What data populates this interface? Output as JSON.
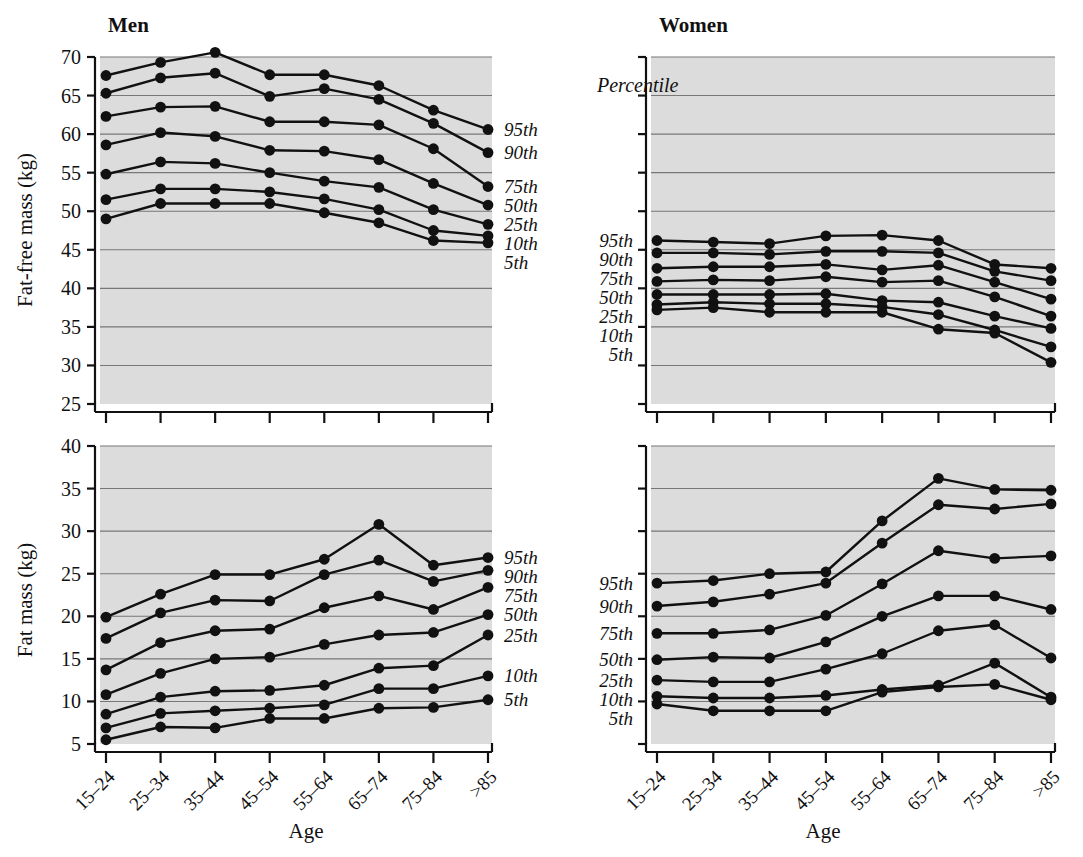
{
  "figure": {
    "panel_titles": {
      "men": "Men",
      "women": "Women"
    },
    "percentile_header": "Percentile",
    "x_axis_title": "Age",
    "y_axis_title_top": "Fat-free mass (kg)",
    "y_axis_title_bottom": "Fat mass (kg)",
    "age_groups": [
      "15–24",
      "25–34",
      "35–44",
      "45–54",
      "55–64",
      "65–74",
      "75–84",
      ">85"
    ],
    "percentile_labels": [
      "95th",
      "90th",
      "75th",
      "50th",
      "25th",
      "10th",
      "5th"
    ],
    "colors": {
      "plot_background": "#dcdcdc",
      "gridline": "#777777",
      "axis": "#111111",
      "marker": "#111111",
      "page_background": "#ffffff"
    }
  },
  "chart_data": [
    {
      "id": "men-fat-free-mass",
      "type": "line",
      "title": "Men",
      "xlabel": "Age",
      "ylabel": "Fat-free mass (kg)",
      "categories": [
        "15–24",
        "25–34",
        "35–44",
        "45–54",
        "55–64",
        "65–74",
        "75–84",
        ">85"
      ],
      "ylim": [
        25,
        70
      ],
      "yticks": [
        25,
        30,
        35,
        40,
        45,
        50,
        55,
        60,
        65,
        70
      ],
      "ytick_labels": [
        "25",
        "30",
        "35",
        "40",
        "45",
        "50",
        "55",
        "60",
        "65",
        "70"
      ],
      "grid": true,
      "legend": "right-edge-inline",
      "series": [
        {
          "name": "95th",
          "values": [
            67.6,
            69.3,
            70.6,
            67.7,
            67.7,
            66.3,
            63.1,
            60.6
          ]
        },
        {
          "name": "90th",
          "values": [
            65.3,
            67.3,
            67.9,
            64.9,
            65.9,
            64.5,
            61.4,
            57.6
          ]
        },
        {
          "name": "75th",
          "values": [
            62.3,
            63.5,
            63.6,
            61.6,
            61.6,
            61.2,
            58.1,
            53.2
          ]
        },
        {
          "name": "50th",
          "values": [
            58.6,
            60.2,
            59.7,
            57.9,
            57.8,
            56.7,
            53.6,
            50.8
          ]
        },
        {
          "name": "25th",
          "values": [
            54.8,
            56.4,
            56.2,
            55.0,
            53.9,
            53.1,
            50.2,
            48.3
          ]
        },
        {
          "name": "10th",
          "values": [
            51.5,
            52.9,
            52.9,
            52.5,
            51.6,
            50.2,
            47.5,
            46.8
          ]
        },
        {
          "name": "5th",
          "values": [
            49.0,
            51.0,
            51.0,
            51.0,
            49.8,
            48.5,
            46.2,
            45.9
          ]
        }
      ]
    },
    {
      "id": "women-fat-free-mass",
      "type": "line",
      "title": "Women",
      "xlabel": "Age",
      "ylabel": "Fat-free mass (kg)",
      "categories": [
        "15–24",
        "25–34",
        "35–44",
        "45–54",
        "55–64",
        "65–74",
        "75–84",
        ">85"
      ],
      "ylim": [
        25,
        70
      ],
      "yticks": [
        25,
        30,
        35,
        40,
        45,
        50,
        55,
        60,
        65,
        70
      ],
      "ytick_labels": [
        "",
        "",
        "",
        "",
        "",
        "",
        "",
        "",
        "",
        ""
      ],
      "grid": true,
      "legend": "left-edge-inline",
      "series": [
        {
          "name": "95th",
          "values": [
            46.2,
            46.0,
            45.8,
            46.8,
            46.9,
            46.2,
            43.1,
            42.6
          ]
        },
        {
          "name": "90th",
          "values": [
            44.6,
            44.6,
            44.4,
            44.8,
            44.8,
            44.6,
            42.2,
            41.0
          ]
        },
        {
          "name": "75th",
          "values": [
            42.6,
            42.8,
            42.8,
            43.1,
            42.4,
            43.0,
            40.8,
            38.6
          ]
        },
        {
          "name": "50th",
          "values": [
            40.9,
            41.1,
            41.0,
            41.5,
            40.8,
            41.0,
            38.9,
            36.4
          ]
        },
        {
          "name": "25th",
          "values": [
            39.2,
            39.2,
            39.2,
            39.3,
            38.4,
            38.2,
            36.4,
            34.8
          ]
        },
        {
          "name": "10th",
          "values": [
            37.9,
            38.2,
            38.0,
            38.0,
            37.6,
            36.6,
            34.6,
            32.4
          ]
        },
        {
          "name": "5th",
          "values": [
            37.2,
            37.5,
            36.9,
            36.9,
            36.9,
            34.7,
            34.2,
            30.4
          ]
        }
      ]
    },
    {
      "id": "men-fat-mass",
      "type": "line",
      "title": "Men",
      "xlabel": "Age",
      "ylabel": "Fat mass (kg)",
      "categories": [
        "15–24",
        "25–34",
        "35–44",
        "45–54",
        "55–64",
        "65–74",
        "75–84",
        ">85"
      ],
      "ylim": [
        5,
        40
      ],
      "yticks": [
        5,
        10,
        15,
        20,
        25,
        30,
        35,
        40
      ],
      "ytick_labels": [
        "5",
        "10",
        "15",
        "20",
        "25",
        "30",
        "35",
        "40"
      ],
      "grid": true,
      "legend": "right-edge-inline",
      "series": [
        {
          "name": "95th",
          "values": [
            19.9,
            22.6,
            24.9,
            24.9,
            26.7,
            30.8,
            26.0,
            26.9
          ]
        },
        {
          "name": "90th",
          "values": [
            17.4,
            20.4,
            21.9,
            21.8,
            24.9,
            26.6,
            24.1,
            25.4
          ]
        },
        {
          "name": "75th",
          "values": [
            13.7,
            16.9,
            18.3,
            18.5,
            21.0,
            22.4,
            20.8,
            23.4
          ]
        },
        {
          "name": "50th",
          "values": [
            10.8,
            13.3,
            15.0,
            15.2,
            16.7,
            17.8,
            18.1,
            20.2
          ]
        },
        {
          "name": "25th",
          "values": [
            8.5,
            10.5,
            11.2,
            11.3,
            11.9,
            13.9,
            14.2,
            17.8
          ]
        },
        {
          "name": "10th",
          "values": [
            6.9,
            8.6,
            8.9,
            9.2,
            9.6,
            11.5,
            11.5,
            13.0
          ]
        },
        {
          "name": "5th",
          "values": [
            5.5,
            7.0,
            6.9,
            8.0,
            8.0,
            9.2,
            9.3,
            10.2
          ]
        }
      ]
    },
    {
      "id": "women-fat-mass",
      "type": "line",
      "title": "Women",
      "xlabel": "Age",
      "ylabel": "Fat mass (kg)",
      "categories": [
        "15–24",
        "25–34",
        "35–44",
        "45–54",
        "55–64",
        "65–74",
        "75–84",
        ">85"
      ],
      "ylim": [
        5,
        40
      ],
      "yticks": [
        5,
        10,
        15,
        20,
        25,
        30,
        35,
        40
      ],
      "ytick_labels": [
        "",
        "",
        "",
        "",
        "",
        "",
        "",
        ""
      ],
      "grid": true,
      "legend": "left-edge-inline",
      "series": [
        {
          "name": "95th",
          "values": [
            23.9,
            24.2,
            25.0,
            25.2,
            31.2,
            36.2,
            34.9,
            34.8
          ]
        },
        {
          "name": "90th",
          "values": [
            21.2,
            21.7,
            22.6,
            23.9,
            28.6,
            33.1,
            32.6,
            33.2
          ]
        },
        {
          "name": "75th",
          "values": [
            18.0,
            18.0,
            18.4,
            20.1,
            23.8,
            27.7,
            26.8,
            27.1
          ]
        },
        {
          "name": "50th",
          "values": [
            14.9,
            15.2,
            15.1,
            17.0,
            20.0,
            22.4,
            22.4,
            20.8
          ]
        },
        {
          "name": "25th",
          "values": [
            12.5,
            12.3,
            12.3,
            13.8,
            15.6,
            18.3,
            19.0,
            15.1
          ]
        },
        {
          "name": "10th",
          "values": [
            10.6,
            10.4,
            10.4,
            10.7,
            11.4,
            11.9,
            14.5,
            10.5
          ]
        },
        {
          "name": "5th",
          "values": [
            9.7,
            8.9,
            8.9,
            8.9,
            11.1,
            11.7,
            12.0,
            10.2
          ]
        }
      ]
    }
  ]
}
